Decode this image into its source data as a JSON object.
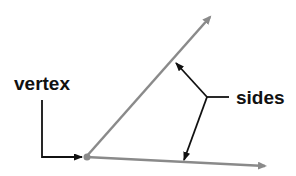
{
  "diagram": {
    "labels": {
      "vertex": "vertex",
      "sides": "sides"
    },
    "colors": {
      "ray": "#8a8a8a",
      "pointer": "#111111",
      "text": "#111111",
      "background": "#ffffff"
    }
  }
}
